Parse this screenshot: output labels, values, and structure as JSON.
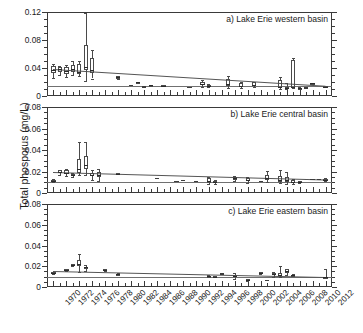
{
  "figure": {
    "ylabel": "Total phosporus (mg/L)",
    "xlabel": ""
  },
  "chart_data": {
    "type": "box",
    "title": "",
    "ylabel": "Total phosporus (mg/L)",
    "xlabel": "",
    "xlim": [
      1969,
      2013
    ],
    "x_major_tick_labels": [
      "1970",
      "1972",
      "1974",
      "1976",
      "1978",
      "1980",
      "1982",
      "1984",
      "1986",
      "1988",
      "1990",
      "1992",
      "1994",
      "1996",
      "1998",
      "2000",
      "2002",
      "2004",
      "2006",
      "2008",
      "2010",
      "2012"
    ],
    "x_minor_tick_step": 1,
    "grid": false,
    "legend": null,
    "panels": [
      {
        "id": "a",
        "title": "a) Lake Erie western basin",
        "ylim": [
          0,
          0.12
        ],
        "ytick_labels": [
          "0",
          "0.04",
          "0.08",
          "0.12"
        ],
        "ytick_values": [
          0,
          0.04,
          0.08,
          0.12
        ],
        "y_minor_step": 0.01,
        "reference_line": 0.015,
        "trend_line": {
          "x_start": 1970,
          "y_start": 0.0385,
          "x_end": 2012,
          "y_end": 0.0145
        },
        "boxes": [
          {
            "year": 1970,
            "low": 0.026,
            "q1": 0.033,
            "median": 0.0375,
            "q3": 0.043,
            "high": 0.046
          },
          {
            "year": 1971,
            "low": 0.03,
            "q1": 0.0345,
            "median": 0.038,
            "q3": 0.041,
            "high": 0.0435
          },
          {
            "year": 1972,
            "low": 0.027,
            "q1": 0.031,
            "median": 0.0355,
            "q3": 0.041,
            "high": 0.045
          },
          {
            "year": 1973,
            "low": 0.03,
            "q1": 0.034,
            "median": 0.0385,
            "q3": 0.045,
            "high": 0.05
          },
          {
            "year": 1974,
            "low": 0.028,
            "q1": 0.0315,
            "median": 0.035,
            "q3": 0.0455,
            "high": 0.05
          },
          {
            "year": 1975,
            "low": 0.022,
            "q1": 0.037,
            "median": 0.041,
            "q3": 0.073,
            "high": 0.118
          },
          {
            "year": 1976,
            "low": 0.025,
            "q1": 0.0335,
            "median": 0.0375,
            "q3": 0.0545,
            "high": 0.066
          },
          {
            "year": 1980,
            "low": 0.024,
            "q1": 0.0245,
            "median": 0.0265,
            "q3": 0.028,
            "high": 0.029
          },
          {
            "year": 1983,
            "low": 0.019,
            "q1": 0.019,
            "median": 0.0195,
            "q3": 0.02,
            "high": 0.02
          },
          {
            "year": 1985,
            "low": 0.015,
            "q1": 0.015,
            "median": 0.0155,
            "q3": 0.016,
            "high": 0.016
          },
          {
            "year": 1987,
            "low": 0.0145,
            "q1": 0.0145,
            "median": 0.015,
            "q3": 0.0155,
            "high": 0.0155
          },
          {
            "year": 1993,
            "low": 0.0135,
            "q1": 0.0155,
            "median": 0.017,
            "q3": 0.0205,
            "high": 0.0225
          },
          {
            "year": 1994,
            "low": 0.0125,
            "q1": 0.0135,
            "median": 0.0145,
            "q3": 0.016,
            "high": 0.017
          },
          {
            "year": 1997,
            "low": 0.012,
            "q1": 0.0145,
            "median": 0.017,
            "q3": 0.0245,
            "high": 0.029
          },
          {
            "year": 1999,
            "low": 0.0115,
            "q1": 0.0125,
            "median": 0.0145,
            "q3": 0.0185,
            "high": 0.02
          },
          {
            "year": 2001,
            "low": 0.0135,
            "q1": 0.0145,
            "median": 0.016,
            "q3": 0.0195,
            "high": 0.02
          },
          {
            "year": 2005,
            "low": 0.0095,
            "q1": 0.0115,
            "median": 0.0135,
            "q3": 0.0235,
            "high": 0.027
          },
          {
            "year": 2006,
            "low": 0.0095,
            "q1": 0.0105,
            "median": 0.0115,
            "q3": 0.0125,
            "high": 0.019
          },
          {
            "year": 2007,
            "low": 0.011,
            "q1": 0.0115,
            "median": 0.0125,
            "q3": 0.052,
            "high": 0.054
          },
          {
            "year": 2008,
            "low": 0.0105,
            "q1": 0.011,
            "median": 0.0115,
            "q3": 0.012,
            "high": 0.0125
          },
          {
            "year": 2010,
            "low": 0.0175,
            "q1": 0.0175,
            "median": 0.018,
            "q3": 0.0185,
            "high": 0.0185
          },
          {
            "year": 2012,
            "low": 0.0125,
            "q1": 0.013,
            "median": 0.0135,
            "q3": 0.014,
            "high": 0.014
          }
        ],
        "points": [
          {
            "year": 1982,
            "value": 0.0155
          },
          {
            "year": 1984,
            "value": 0.013
          },
          {
            "year": 1991,
            "value": 0.0125
          },
          {
            "year": 2009,
            "value": 0.0115
          }
        ]
      },
      {
        "id": "b",
        "title": "b) Lake Erie central basin",
        "ylim": [
          0,
          0.08
        ],
        "ytick_labels": [
          "0",
          "0.02",
          "0.04",
          "0.06",
          "0.08"
        ],
        "ytick_values": [
          0,
          0.02,
          0.04,
          0.06,
          0.08
        ],
        "y_minor_step": 0.005,
        "reference_line": 0.0105,
        "trend_line": {
          "x_start": 1970,
          "y_start": 0.0195,
          "x_end": 2012,
          "y_end": 0.0125
        },
        "boxes": [
          {
            "year": 1970,
            "low": 0.01,
            "q1": 0.0105,
            "median": 0.0115,
            "q3": 0.0125,
            "high": 0.013
          },
          {
            "year": 1971,
            "low": 0.017,
            "q1": 0.0185,
            "median": 0.0195,
            "q3": 0.021,
            "high": 0.0215
          },
          {
            "year": 1972,
            "low": 0.0155,
            "q1": 0.0175,
            "median": 0.019,
            "q3": 0.021,
            "high": 0.0225
          },
          {
            "year": 1973,
            "low": 0.0145,
            "q1": 0.016,
            "median": 0.017,
            "q3": 0.018,
            "high": 0.0185
          },
          {
            "year": 1974,
            "low": 0.0165,
            "q1": 0.019,
            "median": 0.0225,
            "q3": 0.0315,
            "high": 0.047
          },
          {
            "year": 1975,
            "low": 0.0165,
            "q1": 0.0225,
            "median": 0.0265,
            "q3": 0.0345,
            "high": 0.047
          },
          {
            "year": 1976,
            "low": 0.0125,
            "q1": 0.0155,
            "median": 0.017,
            "q3": 0.019,
            "high": 0.021
          },
          {
            "year": 1977,
            "low": 0.0115,
            "q1": 0.0145,
            "median": 0.0165,
            "q3": 0.0195,
            "high": 0.0225
          },
          {
            "year": 1980,
            "low": 0.0175,
            "q1": 0.0175,
            "median": 0.018,
            "q3": 0.0185,
            "high": 0.0185
          },
          {
            "year": 1994,
            "low": 0.0085,
            "q1": 0.0095,
            "median": 0.011,
            "q3": 0.0135,
            "high": 0.0145
          },
          {
            "year": 1995,
            "low": 0.0085,
            "q1": 0.0095,
            "median": 0.0105,
            "q3": 0.0115,
            "high": 0.012
          },
          {
            "year": 1998,
            "low": 0.011,
            "q1": 0.0125,
            "median": 0.0135,
            "q3": 0.015,
            "high": 0.0155
          },
          {
            "year": 2000,
            "low": 0.0095,
            "q1": 0.0115,
            "median": 0.0125,
            "q3": 0.014,
            "high": 0.0145
          },
          {
            "year": 2003,
            "low": 0.0105,
            "q1": 0.012,
            "median": 0.0135,
            "q3": 0.0165,
            "high": 0.0205
          },
          {
            "year": 2005,
            "low": 0.009,
            "q1": 0.0105,
            "median": 0.0125,
            "q3": 0.016,
            "high": 0.0215
          },
          {
            "year": 2006,
            "low": 0.0085,
            "q1": 0.0105,
            "median": 0.012,
            "q3": 0.0145,
            "high": 0.0195
          },
          {
            "year": 2007,
            "low": 0.008,
            "q1": 0.009,
            "median": 0.0105,
            "q3": 0.0125,
            "high": 0.013
          },
          {
            "year": 2008,
            "low": 0.0095,
            "q1": 0.01,
            "median": 0.0105,
            "q3": 0.011,
            "high": 0.0115
          },
          {
            "year": 2012,
            "low": 0.0115,
            "q1": 0.012,
            "median": 0.0125,
            "q3": 0.013,
            "high": 0.0135
          }
        ],
        "points": [
          {
            "year": 1986,
            "value": 0.0135
          },
          {
            "year": 1989,
            "value": 0.0105
          },
          {
            "year": 1990,
            "value": 0.0115
          },
          {
            "year": 1992,
            "value": 0.0105
          },
          {
            "year": 2002,
            "value": 0.0105
          },
          {
            "year": 2010,
            "value": 0.0125
          },
          {
            "year": 2011,
            "value": 0.0125
          }
        ]
      },
      {
        "id": "c",
        "title": "c) Lake Erie eastern basin",
        "ylim": [
          0,
          0.08
        ],
        "ytick_labels": [
          "0",
          "0.02",
          "0.04",
          "0.06",
          "0.08"
        ],
        "ytick_values": [
          0,
          0.02,
          0.04,
          0.06,
          0.08
        ],
        "y_minor_step": 0.005,
        "reference_line": 0.0098,
        "trend_line": {
          "x_start": 1970,
          "y_start": 0.0155,
          "x_end": 2012,
          "y_end": 0.0098
        },
        "boxes": [
          {
            "year": 1970,
            "low": 0.0125,
            "q1": 0.013,
            "median": 0.0135,
            "q3": 0.014,
            "high": 0.0145
          },
          {
            "year": 1972,
            "low": 0.0155,
            "q1": 0.016,
            "median": 0.0165,
            "q3": 0.017,
            "high": 0.0175
          },
          {
            "year": 1973,
            "low": 0.0205,
            "q1": 0.021,
            "median": 0.0215,
            "q3": 0.022,
            "high": 0.0225
          },
          {
            "year": 1974,
            "low": 0.0145,
            "q1": 0.0205,
            "median": 0.0225,
            "q3": 0.0265,
            "high": 0.032
          },
          {
            "year": 1975,
            "low": 0.0155,
            "q1": 0.0185,
            "median": 0.019,
            "q3": 0.0195,
            "high": 0.021
          },
          {
            "year": 1978,
            "low": 0.0155,
            "q1": 0.016,
            "median": 0.0165,
            "q3": 0.017,
            "high": 0.0175
          },
          {
            "year": 1980,
            "low": 0.0115,
            "q1": 0.012,
            "median": 0.0125,
            "q3": 0.013,
            "high": 0.0135
          },
          {
            "year": 1994,
            "low": 0.0095,
            "q1": 0.01,
            "median": 0.0105,
            "q3": 0.011,
            "high": 0.0115
          },
          {
            "year": 1995,
            "low": 0.0095,
            "q1": 0.0095,
            "median": 0.01,
            "q3": 0.0105,
            "high": 0.011
          },
          {
            "year": 1998,
            "low": 0.008,
            "q1": 0.0095,
            "median": 0.0105,
            "q3": 0.012,
            "high": 0.0135
          },
          {
            "year": 2000,
            "low": 0.006,
            "q1": 0.0065,
            "median": 0.007,
            "q3": 0.0075,
            "high": 0.008
          },
          {
            "year": 2002,
            "low": 0.0125,
            "q1": 0.013,
            "median": 0.0135,
            "q3": 0.014,
            "high": 0.0145
          },
          {
            "year": 2004,
            "low": 0.01,
            "q1": 0.0115,
            "median": 0.0125,
            "q3": 0.0135,
            "high": 0.0145
          },
          {
            "year": 2005,
            "low": 0.0095,
            "q1": 0.0105,
            "median": 0.0115,
            "q3": 0.0135,
            "high": 0.02
          },
          {
            "year": 2006,
            "low": 0.0115,
            "q1": 0.0135,
            "median": 0.0155,
            "q3": 0.017,
            "high": 0.0175
          },
          {
            "year": 2007,
            "low": 0.0105,
            "q1": 0.011,
            "median": 0.0115,
            "q3": 0.012,
            "high": 0.0125
          },
          {
            "year": 2012,
            "low": 0.0085,
            "q1": 0.009,
            "median": 0.0095,
            "q3": 0.01,
            "high": 0.0175
          }
        ],
        "points": [
          {
            "year": 1996,
            "value": 0.0125
          },
          {
            "year": 2003,
            "value": 0.0065
          }
        ]
      }
    ]
  }
}
